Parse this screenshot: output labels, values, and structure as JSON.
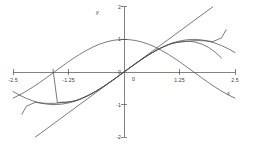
{
  "chart_data": {
    "type": "line",
    "title": "",
    "xlabel": "x",
    "ylabel": "y",
    "xlim": [
      -2.5,
      2.5
    ],
    "ylim": [
      -2,
      2
    ],
    "grid": false,
    "legend": "none",
    "x_ticks": [
      {
        "value": -2.5,
        "label": "-2.5"
      },
      {
        "value": -1.25,
        "label": "-1.25"
      },
      {
        "value": 0,
        "label": "0"
      },
      {
        "value": 1.25,
        "label": "1.25"
      },
      {
        "value": 2.5,
        "label": "2.5"
      }
    ],
    "y_ticks": [
      {
        "value": 2,
        "label": "2"
      },
      {
        "value": 1,
        "label": "1"
      },
      {
        "value": 0,
        "label": "0"
      },
      {
        "value": -1,
        "label": "-1"
      },
      {
        "value": -2,
        "label": "-2"
      }
    ],
    "series": [
      {
        "name": "sin(x)",
        "color": "#4d4d4d",
        "points": [
          [
            -2.5,
            -0.599
          ],
          [
            -2.35,
            -0.711
          ],
          [
            -2.2,
            -0.808
          ],
          [
            -2.05,
            -0.888
          ],
          [
            -1.9,
            -0.946
          ],
          [
            -1.75,
            -0.984
          ],
          [
            -1.6,
            -1.0
          ],
          [
            -1.45,
            -0.993
          ],
          [
            -1.3,
            -0.964
          ],
          [
            -1.15,
            -0.913
          ],
          [
            -1.0,
            -0.841
          ],
          [
            -0.85,
            -0.751
          ],
          [
            -0.7,
            -0.644
          ],
          [
            -0.55,
            -0.523
          ],
          [
            -0.4,
            -0.389
          ],
          [
            -0.25,
            -0.247
          ],
          [
            -0.1,
            -0.1
          ],
          [
            0.0,
            0.0
          ],
          [
            0.1,
            0.1
          ],
          [
            0.25,
            0.247
          ],
          [
            0.4,
            0.389
          ],
          [
            0.55,
            0.523
          ],
          [
            0.7,
            0.644
          ],
          [
            0.85,
            0.751
          ],
          [
            1.0,
            0.841
          ],
          [
            1.15,
            0.913
          ],
          [
            1.3,
            0.964
          ],
          [
            1.45,
            0.993
          ],
          [
            1.6,
            1.0
          ],
          [
            1.75,
            0.984
          ],
          [
            1.9,
            0.946
          ],
          [
            2.05,
            0.888
          ],
          [
            2.2,
            0.808
          ],
          [
            2.35,
            0.711
          ],
          [
            2.5,
            0.599
          ]
        ]
      },
      {
        "name": "cos(x)",
        "color": "#4d4d4d",
        "points": [
          [
            -2.5,
            -0.801
          ],
          [
            -2.35,
            -0.703
          ],
          [
            -2.2,
            -0.589
          ],
          [
            -2.05,
            -0.46
          ],
          [
            -1.9,
            -0.323
          ],
          [
            -1.75,
            -0.178
          ],
          [
            -1.6,
            -0.029
          ],
          [
            -1.45,
            0.12
          ],
          [
            -1.3,
            0.268
          ],
          [
            -1.15,
            0.408
          ],
          [
            -1.0,
            0.54
          ],
          [
            -0.85,
            0.66
          ],
          [
            -0.7,
            0.765
          ],
          [
            -0.55,
            0.853
          ],
          [
            -0.4,
            0.921
          ],
          [
            -0.25,
            0.969
          ],
          [
            -0.1,
            0.995
          ],
          [
            0.0,
            1.0
          ],
          [
            0.1,
            0.995
          ],
          [
            0.25,
            0.969
          ],
          [
            0.4,
            0.921
          ],
          [
            0.55,
            0.853
          ],
          [
            0.7,
            0.765
          ],
          [
            0.85,
            0.66
          ],
          [
            1.0,
            0.54
          ],
          [
            1.15,
            0.408
          ],
          [
            1.3,
            0.268
          ],
          [
            1.45,
            0.12
          ],
          [
            1.6,
            -0.029
          ],
          [
            1.75,
            -0.178
          ],
          [
            1.9,
            -0.323
          ],
          [
            2.05,
            -0.46
          ],
          [
            2.2,
            -0.589
          ],
          [
            2.35,
            -0.703
          ],
          [
            2.5,
            -0.801
          ]
        ]
      },
      {
        "name": "y = x",
        "color": "#4d4d4d",
        "points": [
          [
            -2.0,
            -2.0
          ],
          [
            2.0,
            2.0
          ]
        ]
      },
      {
        "name": "x - x^3/6",
        "color": "#4d4d4d",
        "points": [
          [
            -1.6,
            0.0827
          ],
          [
            -1.5,
            -0.9375
          ],
          [
            -1.4,
            -0.9267
          ],
          [
            -1.3,
            -0.9337
          ],
          [
            -1.2,
            -0.912
          ],
          [
            -1.1,
            -0.8782
          ],
          [
            -1.0,
            -0.8333
          ],
          [
            -0.9,
            -0.7785
          ],
          [
            -0.75,
            -0.6797
          ],
          [
            -0.6,
            -0.564
          ],
          [
            -0.45,
            -0.4348
          ],
          [
            -0.3,
            -0.2955
          ],
          [
            -0.15,
            -0.1494
          ],
          [
            0.0,
            0.0
          ],
          [
            0.15,
            0.1494
          ],
          [
            0.3,
            0.2955
          ],
          [
            0.45,
            0.4348
          ],
          [
            0.6,
            0.564
          ],
          [
            0.75,
            0.6797
          ],
          [
            0.9,
            0.7785
          ],
          [
            1.0,
            0.8333
          ],
          [
            1.1,
            0.8782
          ],
          [
            1.2,
            0.912
          ],
          [
            1.3,
            0.9337
          ],
          [
            1.4,
            0.9427
          ],
          [
            1.5,
            0.9375
          ],
          [
            1.6,
            0.9173
          ],
          [
            1.75,
            0.8568
          ],
          [
            1.9,
            0.7575
          ],
          [
            2.05,
            0.6142
          ],
          [
            2.2,
            0.4253
          ]
        ]
      },
      {
        "name": "x - x^3/6 + x^5/120",
        "color": "#4d4d4d",
        "points": [
          [
            -2.3,
            -1.3
          ],
          [
            -2.2,
            -1.05
          ],
          [
            -2.1,
            -0.99
          ],
          [
            -2.0,
            -0.9333
          ],
          [
            -1.85,
            -0.954
          ],
          [
            -1.7,
            -0.962
          ],
          [
            -1.55,
            -0.9598
          ],
          [
            -1.4,
            -0.9379
          ],
          [
            -1.25,
            -0.9128
          ],
          [
            -1.1,
            -0.8917
          ],
          [
            -0.95,
            -0.8134
          ],
          [
            -0.8,
            -0.7174
          ],
          [
            -0.65,
            -0.6052
          ],
          [
            -0.5,
            -0.4794
          ],
          [
            -0.35,
            -0.3429
          ],
          [
            -0.2,
            -0.1987
          ],
          [
            -0.05,
            -0.05
          ],
          [
            0.0,
            0.0
          ],
          [
            0.05,
            0.05
          ],
          [
            0.2,
            0.1987
          ],
          [
            0.35,
            0.3429
          ],
          [
            0.5,
            0.4794
          ],
          [
            0.65,
            0.6052
          ],
          [
            0.8,
            0.7174
          ],
          [
            0.95,
            0.8134
          ],
          [
            1.1,
            0.8917
          ],
          [
            1.25,
            0.9128
          ],
          [
            1.4,
            0.9379
          ],
          [
            1.55,
            0.9598
          ],
          [
            1.7,
            0.962
          ],
          [
            1.85,
            0.954
          ],
          [
            2.0,
            0.9333
          ],
          [
            2.1,
            0.99
          ],
          [
            2.2,
            1.05
          ],
          [
            2.3,
            1.3
          ]
        ]
      }
    ],
    "annotations": []
  },
  "axes": {
    "x_axis_label": "x",
    "y_axis_label": "y"
  }
}
